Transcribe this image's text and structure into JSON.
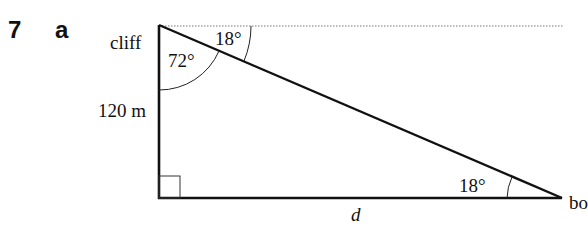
{
  "question": {
    "number": "7",
    "part": "a"
  },
  "diagram": {
    "type": "right-triangle",
    "labels": {
      "cliff": "cliff",
      "height": "120 m",
      "base": "d",
      "boat": "bo",
      "angle_top_inside": "72°",
      "angle_depression": "18°",
      "angle_bottom": "18°"
    },
    "vertices": {
      "cliff_top": [
        159,
        25
      ],
      "cliff_base": [
        159,
        198
      ],
      "boat": [
        561,
        198
      ]
    },
    "horizontal_line": "dotted",
    "right_angle_marker": "cliff_base"
  }
}
